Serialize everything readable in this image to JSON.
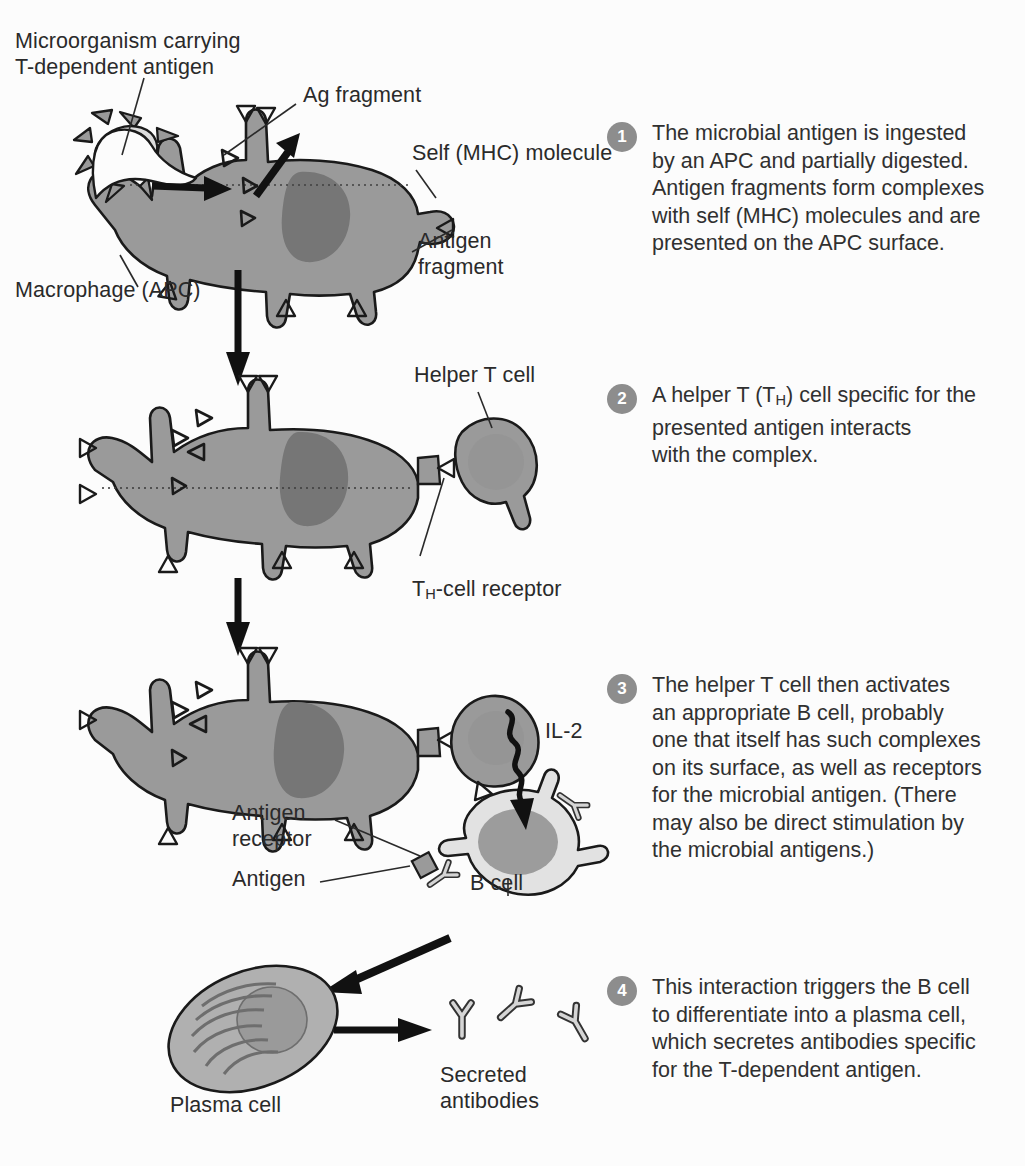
{
  "figure": {
    "background_color": "#fcfcfc",
    "text_color": "#2a2a2a",
    "badge_color": "#8d8d8d",
    "badge_text_color": "#ffffff"
  },
  "palette": {
    "outline": "#1a1a1a",
    "macrophage_cytoplasm": "#9a9a9a",
    "macrophage_nucleus": "#767676",
    "t_cell_body": "#9a9a9a",
    "t_cell_nucleus": "#8c8c8c",
    "b_cell_cytoplasm": "#e2e2e2",
    "b_cell_nucleus": "#9c9c9c",
    "plasma_cell_cytoplasm": "#b0b0b0",
    "plasma_cell_nucleus": "#9a9a9a",
    "microorganism_body": "#d9d9d9",
    "antibody_fill": "#d5d5d5",
    "arrow_black": "#111111"
  },
  "labels": {
    "microorganism": "Microorganism carrying\nT-dependent antigen",
    "ag_fragment": "Ag fragment",
    "self_mhc": "Self (MHC) molecule",
    "antigen_fragment": "Antigen\nfragment",
    "macrophage": "Macrophage (APC)",
    "helper_t_cell": "Helper T cell",
    "th_cell_receptor_pre": "T",
    "th_cell_receptor_sub": "H",
    "th_cell_receptor_post": "-cell receptor",
    "il2": "IL-2",
    "antigen_receptor": "Antigen\nreceptor",
    "antigen": "Antigen",
    "b_cell": "B cell",
    "plasma_cell": "Plasma cell",
    "secreted_antibodies": "Secreted\nantibodies"
  },
  "steps": [
    {
      "number": "1",
      "text": "The microbial antigen is ingested\nby an APC and partially digested.\nAntigen fragments form complexes\nwith self (MHC) molecules and are\npresented on the APC surface."
    },
    {
      "number": "2",
      "text_pre": "A helper T (T",
      "text_sub": "H",
      "text_post": ") cell specific for the\npresented antigen interacts\nwith the complex."
    },
    {
      "number": "3",
      "text": "The helper T cell then activates\nan appropriate B cell, probably\none that itself has such complexes\non its surface, as well as receptors\nfor the microbial antigen. (There\nmay also be direct stimulation by\nthe microbial antigens.)"
    },
    {
      "number": "4",
      "text": "This interaction triggers the B cell\nto differentiate into a plasma cell,\nwhich secretes antibodies specific\nfor the T-dependent antigen."
    }
  ]
}
